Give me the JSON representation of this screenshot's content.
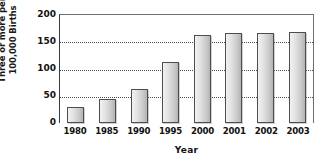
{
  "chart_data": {
    "type": "bar",
    "title": "",
    "xlabel": "Year",
    "ylabel": "Three or more per 100,000 Births",
    "ylabel_lines": [
      "Three or more per",
      "100,000 Births"
    ],
    "categories": [
      "1980",
      "1985",
      "1990",
      "1995",
      "2000",
      "2001",
      "2002",
      "2003"
    ],
    "values": [
      30,
      45,
      63,
      113,
      163,
      167,
      166,
      169
    ],
    "ylim": [
      0,
      200
    ],
    "yticks": [
      0,
      50,
      100,
      150,
      200
    ],
    "ytick_labels": [
      "0",
      "50",
      "100",
      "150",
      "200"
    ],
    "gridlines": [
      50,
      100,
      150
    ],
    "grid": true,
    "legend": null,
    "bar_color": "#d8d8d8",
    "bar_edge_color": "#4d4d4d",
    "axis_color": "#3a3a3a",
    "grid_color": "#4a4a4a"
  }
}
